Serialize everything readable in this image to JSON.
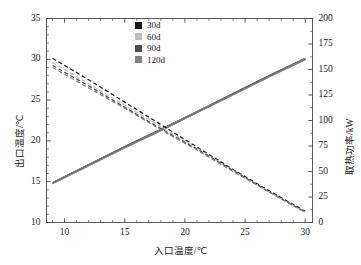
{
  "chart_data": {
    "type": "line",
    "title": "",
    "xlabel": "入口温度/℃",
    "ylabel": "出口温度/℃",
    "ylabel_right": "取热功率/kW",
    "xlim": [
      8.5,
      30.6
    ],
    "ylim": [
      10,
      35
    ],
    "ylim_right": [
      0,
      200
    ],
    "xticks": [
      10,
      15,
      20,
      25,
      30
    ],
    "yticks": [
      10,
      15,
      20,
      25,
      30,
      35
    ],
    "yticks_right": [
      0,
      25,
      50,
      75,
      100,
      125,
      150,
      175,
      200
    ],
    "xminor_step": 1,
    "yminor_step": 1,
    "yminor_step_right": 12.5,
    "grid": false,
    "legend_position": "top-center",
    "legend": [
      "30d",
      "60d",
      "90d",
      "120d"
    ],
    "colors": {
      "30d": "#1a1a1a",
      "60d": "#bdbdbd",
      "90d": "#4d4d4d",
      "120d": "#808080"
    },
    "series": [
      {
        "name": "30d",
        "axis": "left",
        "style": "solid",
        "color": "#1a1a1a",
        "x": [
          9,
          12,
          15,
          18,
          21,
          24,
          27,
          30
        ],
        "values": [
          14.9,
          17.1,
          19.3,
          21.4,
          23.6,
          25.8,
          28.0,
          30.1
        ]
      },
      {
        "name": "60d",
        "axis": "left",
        "style": "solid",
        "color": "#bdbdbd",
        "x": [
          9,
          12,
          15,
          18,
          21,
          24,
          27,
          30
        ],
        "values": [
          14.85,
          17.05,
          19.25,
          21.35,
          23.55,
          25.75,
          27.95,
          30.05
        ]
      },
      {
        "name": "90d",
        "axis": "left",
        "style": "solid",
        "color": "#4d4d4d",
        "x": [
          9,
          12,
          15,
          18,
          21,
          24,
          27,
          30
        ],
        "values": [
          14.8,
          17.0,
          19.2,
          21.3,
          23.5,
          25.7,
          27.9,
          30.0
        ]
      },
      {
        "name": "120d",
        "axis": "left",
        "style": "solid",
        "color": "#808080",
        "x": [
          9,
          12,
          15,
          18,
          21,
          24,
          27,
          30
        ],
        "values": [
          14.75,
          16.95,
          19.15,
          21.25,
          23.45,
          25.65,
          27.85,
          29.95
        ]
      },
      {
        "name": "30d",
        "axis": "right",
        "style": "dashed",
        "color": "#1a1a1a",
        "x": [
          9,
          12,
          15,
          18,
          21,
          24,
          27,
          30
        ],
        "values": [
          161,
          140,
          118,
          96,
          74,
          52,
          31,
          11
        ]
      },
      {
        "name": "60d",
        "axis": "right",
        "style": "dashed",
        "color": "#bdbdbd",
        "x": [
          9,
          12,
          15,
          18,
          21,
          24,
          27,
          30
        ],
        "values": [
          157,
          136,
          115,
          94,
          73,
          51,
          30,
          10
        ]
      },
      {
        "name": "90d",
        "axis": "right",
        "style": "dashed",
        "color": "#4d4d4d",
        "x": [
          9,
          12,
          15,
          18,
          21,
          24,
          27,
          30
        ],
        "values": [
          154,
          134,
          113,
          92,
          72,
          51,
          30,
          10
        ]
      },
      {
        "name": "120d",
        "axis": "right",
        "style": "dashed",
        "color": "#808080",
        "x": [
          9,
          12,
          15,
          18,
          21,
          24,
          27,
          30
        ],
        "values": [
          152,
          132,
          112,
          91,
          71,
          50,
          30,
          10
        ]
      }
    ]
  },
  "axes": {
    "x_tick_labels": [
      "10",
      "15",
      "20",
      "25",
      "30"
    ],
    "y_left_tick_labels": [
      "10",
      "15",
      "20",
      "25",
      "30",
      "35"
    ],
    "y_right_tick_labels": [
      "0",
      "25",
      "50",
      "75",
      "100",
      "125",
      "150",
      "175",
      "200"
    ]
  }
}
